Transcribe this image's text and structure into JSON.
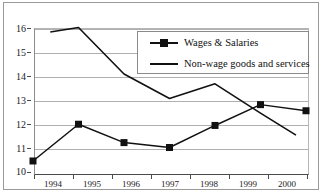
{
  "chart_data": {
    "type": "line",
    "title": "",
    "subtitle": "",
    "xlabel": "",
    "ylabel": "",
    "categories": [
      "1994",
      "1995",
      "1996",
      "1997",
      "1998",
      "1999",
      "2000"
    ],
    "xlim": [
      1994,
      2000
    ],
    "ylim": [
      10,
      16
    ],
    "yticks": [
      "10",
      "11",
      "12",
      "13",
      "14",
      "15",
      "16"
    ],
    "grid": true,
    "legend_position": "top-right",
    "series": [
      {
        "name": "Wages & Salaries",
        "marker": "square",
        "color": "#111111",
        "values": [
          10.45,
          11.95,
          11.2,
          11.0,
          11.9,
          12.75,
          12.5
        ]
      },
      {
        "name": "Non-wage goods and services",
        "marker": "none",
        "color": "#111111",
        "values": [
          15.6,
          15.9,
          14.0,
          13.0,
          13.6,
          12.4,
          11.25
        ]
      }
    ]
  },
  "legend": {
    "items": [
      {
        "label": "Wages & Salaries",
        "key": "line-with-square-marker"
      },
      {
        "label": "Non-wage goods and services",
        "key": "plain-line"
      }
    ]
  },
  "axes": {
    "y_tick_labels": [
      "16",
      "15",
      "14",
      "13",
      "12",
      "11",
      "10"
    ],
    "x_tick_labels": [
      "1994",
      "1995",
      "1996",
      "1997",
      "1998",
      "1999",
      "2000"
    ]
  }
}
